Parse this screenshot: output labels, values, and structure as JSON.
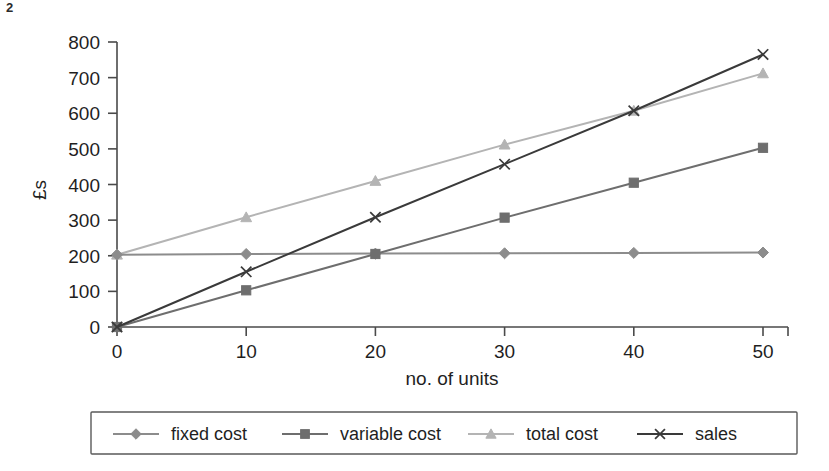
{
  "corner_mark": "2",
  "chart_data": {
    "type": "line",
    "title": "",
    "xlabel": "no. of units",
    "ylabel": "£s",
    "x": [
      0,
      10,
      20,
      30,
      40,
      50
    ],
    "xticklabels": [
      "0",
      "10",
      "20",
      "30",
      "40",
      "50"
    ],
    "yticklabels": [
      "0",
      "100",
      "200",
      "300",
      "400",
      "500",
      "600",
      "700",
      "800"
    ],
    "yticks": [
      0,
      100,
      200,
      300,
      400,
      500,
      600,
      700,
      800
    ],
    "xlim": [
      0,
      50
    ],
    "ylim": [
      0,
      800
    ],
    "grid": false,
    "legend_position": "bottom",
    "series": [
      {
        "name": "fixed cost",
        "marker": "diamond",
        "color": "#8c8c8c",
        "values": [
          203,
          205,
          206,
          207,
          208,
          209
        ]
      },
      {
        "name": "variable cost",
        "marker": "square",
        "color": "#6e6e6e",
        "values": [
          0,
          103,
          205,
          307,
          405,
          503
        ]
      },
      {
        "name": "total cost",
        "marker": "triangle",
        "color": "#b4b4b4",
        "values": [
          203,
          308,
          410,
          512,
          607,
          712
        ]
      },
      {
        "name": "sales",
        "marker": "cross",
        "color": "#3a3a3a",
        "values": [
          0,
          155,
          308,
          457,
          607,
          765
        ]
      }
    ]
  },
  "legend": {
    "items": [
      {
        "label": "fixed cost",
        "marker": "diamond",
        "color": "#8c8c8c"
      },
      {
        "label": "variable cost",
        "marker": "square",
        "color": "#6e6e6e"
      },
      {
        "label": "total cost",
        "marker": "triangle",
        "color": "#b4b4b4"
      },
      {
        "label": "sales",
        "marker": "cross",
        "color": "#3a3a3a"
      }
    ]
  }
}
